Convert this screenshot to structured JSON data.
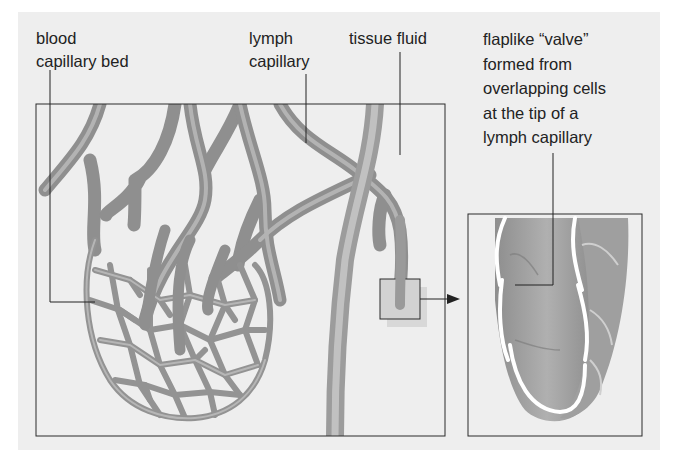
{
  "figure": {
    "labels": {
      "blood_capillary_bed": [
        "blood",
        "capillary bed"
      ],
      "lymph_capillary": [
        "lymph",
        "capillary"
      ],
      "tissue_fluid": [
        "tissue fluid"
      ],
      "valve": [
        "flaplike “valve”",
        "formed from",
        "overlapping cells",
        "at the tip of a",
        "lymph capillary"
      ]
    },
    "colors": {
      "background": "#eeeeee",
      "vessel": "#9a9a9a",
      "vessel_highlight": "#c4c4c4",
      "frame": "#2a2a2a",
      "valve_edge": "#ffffff"
    }
  }
}
